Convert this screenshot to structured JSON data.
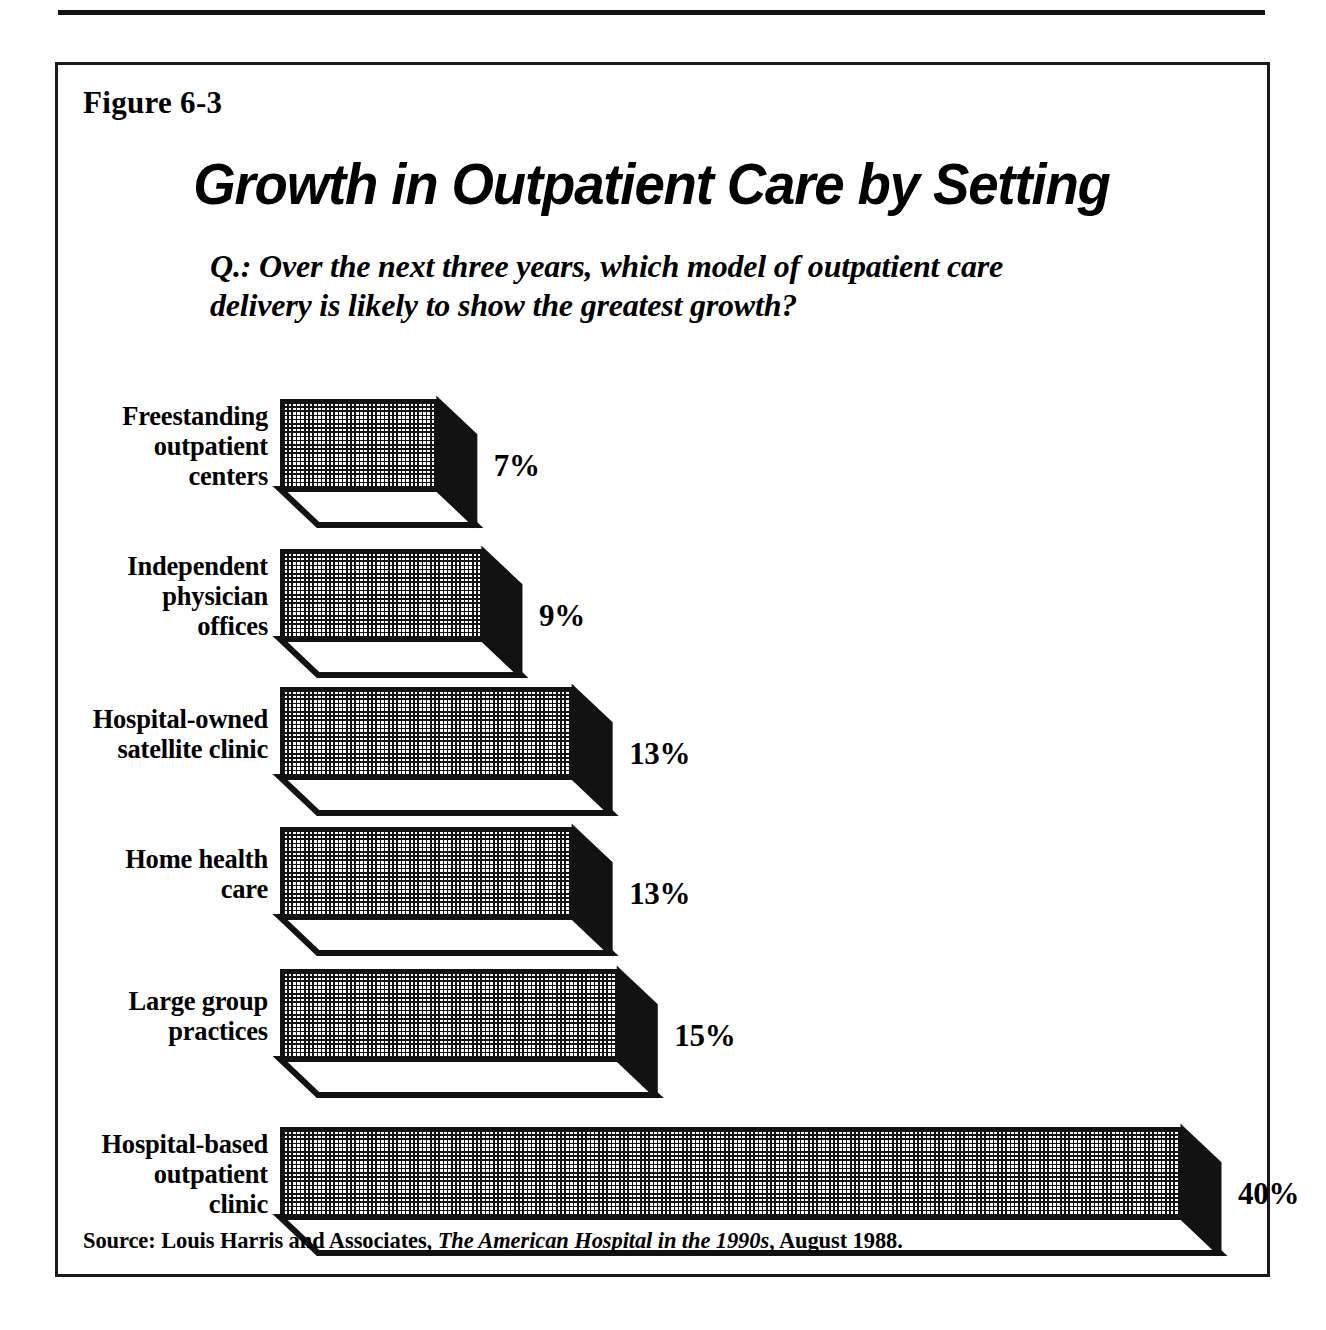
{
  "figure": {
    "label": "Figure 6-3",
    "title": "Growth in Outpatient Care by Setting",
    "question": "Q.: Over the next three years, which model of outpatient care delivery is likely to show the greatest growth?",
    "source_prefix": "Source: Louis Harris and Associates, ",
    "source_italic": "The American Hospital in the 1990s",
    "source_suffix": ", August 1988."
  },
  "chart_data": {
    "type": "bar",
    "orientation": "horizontal",
    "title": "Growth in Outpatient Care by Setting",
    "subtitle": "Q.: Over the next three years, which model of outpatient care delivery is likely to show the greatest growth?",
    "xlabel": "",
    "ylabel": "",
    "xlim": [
      0,
      40
    ],
    "grid": false,
    "legend": false,
    "unit": "%",
    "categories": [
      "Freestanding outpatient centers",
      "Independent physician offices",
      "Hospital-owned satellite clinic",
      "Home health care",
      "Large group practices",
      "Hospital-based outpatient clinic"
    ],
    "values": [
      7,
      9,
      13,
      13,
      15,
      40
    ],
    "value_labels": [
      "7%",
      "9%",
      "13%",
      "13%",
      "15%",
      "40%"
    ],
    "bars": [
      {
        "label_lines": [
          "Freestanding",
          "outpatient",
          "centers"
        ],
        "value": 7,
        "value_label": "7%"
      },
      {
        "label_lines": [
          "Independent",
          "physician",
          "offices"
        ],
        "value": 9,
        "value_label": "9%"
      },
      {
        "label_lines": [
          "Hospital-owned",
          "satellite clinic"
        ],
        "value": 13,
        "value_label": "13%"
      },
      {
        "label_lines": [
          "Home health",
          "care"
        ],
        "value": 13,
        "value_label": "13%"
      },
      {
        "label_lines": [
          "Large group",
          "practices"
        ],
        "value": 15,
        "value_label": "15%"
      },
      {
        "label_lines": [
          "Hospital-based",
          "outpatient",
          "clinic"
        ],
        "value": 40,
        "value_label": "40%"
      }
    ],
    "colors": {
      "bar_fill_pattern": "#121212",
      "bar_background": "#ffffff",
      "bar_side_face": "#121212",
      "frame": "#1a1a1a",
      "text": "#000000"
    }
  }
}
